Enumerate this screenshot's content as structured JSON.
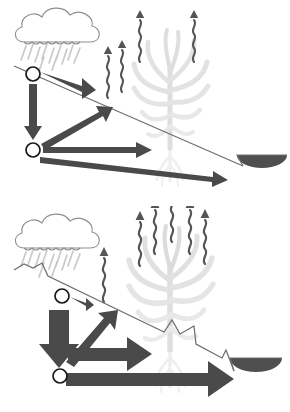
{
  "figure": {
    "background_color": "#ffffff",
    "width": 290,
    "height": 412,
    "panel_count": 2
  },
  "palette": {
    "arrow_gray": "#4a4a4a",
    "arrow_gray_dark": "#3f3f3f",
    "soil_line": "#6e6e6e",
    "cloud_outline": "#8f8f8f",
    "rain_streak": "#c9c9c9",
    "plant_silhouette": "#e2e2e2",
    "plant_root": "#ececec",
    "wavy_arrow": "#555555",
    "pond_fill": "#4f4f4f",
    "node_fill": "#ffffff",
    "node_stroke": "#1a1a1a"
  },
  "panels": [
    {
      "id": "panel-top",
      "name": "sloping-land-panel",
      "scenario": "Conventional sloping cropland",
      "terrain": {
        "type": "smooth-slope",
        "has_terraces": false,
        "terrace_count": 0,
        "start_point": [
          14,
          66
        ],
        "end_point": [
          243,
          166
        ]
      },
      "cloud": {
        "name": "rain-cloud",
        "center": [
          60,
          34
        ],
        "rain_streak_count": 11,
        "rain_intensity": "moderate"
      },
      "nodes": [
        {
          "name": "surface-water-node",
          "cx": 33,
          "cy": 74,
          "r": 7
        },
        {
          "name": "soil-water-node",
          "cx": 33,
          "cy": 150,
          "r": 7
        }
      ],
      "flows": [
        {
          "name": "runoff-arrow",
          "label": "Runoff",
          "direction": "downslope-right",
          "magnitude": "large",
          "style": "wedge"
        },
        {
          "name": "infiltration-arrow",
          "label": "Infiltration",
          "direction": "down",
          "magnitude": "medium",
          "style": "straight"
        },
        {
          "name": "capillary-rise-arrow",
          "label": "Capillary rise / uptake",
          "direction": "up-right",
          "magnitude": "medium",
          "style": "straight"
        },
        {
          "name": "soil-water-storage-arrow",
          "label": "Soil water storage",
          "direction": "right",
          "magnitude": "small",
          "style": "straight"
        },
        {
          "name": "lateral-flow-arrow",
          "label": "Lateral subsurface flow to pond",
          "direction": "right-down",
          "magnitude": "medium",
          "style": "tapered"
        }
      ],
      "evapotranspiration": {
        "name": "evapotranspiration-arrows",
        "count": 4,
        "magnitude": "moderate",
        "arrows": [
          {
            "x": 108,
            "y_bottom": 98,
            "height": 50
          },
          {
            "x": 122,
            "y_bottom": 92,
            "height": 48
          },
          {
            "x": 140,
            "y_bottom": 62,
            "height": 50
          },
          {
            "x": 194,
            "y_bottom": 62,
            "height": 48
          }
        ]
      },
      "plant": {
        "name": "crop-silhouette",
        "species": "maize",
        "vigor": "low",
        "x": 170,
        "y": 30,
        "scale": 1.0
      },
      "pond": {
        "name": "collection-pond",
        "cx": 262,
        "cy": 167,
        "rx": 25,
        "ry": 13,
        "fill_level": "partial"
      }
    },
    {
      "id": "panel-bottom",
      "name": "terraced-land-panel",
      "scenario": "Terraced cropland",
      "terrain": {
        "type": "terraced-slope",
        "has_terraces": true,
        "terrace_count": 3,
        "start_point": [
          14,
          64
        ],
        "end_point": [
          234,
          165
        ]
      },
      "cloud": {
        "name": "rain-cloud",
        "center": [
          60,
          34
        ],
        "rain_streak_count": 11,
        "rain_intensity": "moderate"
      },
      "nodes": [
        {
          "name": "surface-water-node",
          "cx": 62,
          "cy": 90,
          "r": 7
        },
        {
          "name": "soil-water-node",
          "cx": 60,
          "cy": 170,
          "r": 7
        }
      ],
      "flows": [
        {
          "name": "runoff-arrow",
          "label": "Runoff (reduced)",
          "direction": "downslope-right",
          "magnitude": "small",
          "style": "wedge"
        },
        {
          "name": "infiltration-arrow",
          "label": "Infiltration (increased)",
          "direction": "down",
          "magnitude": "large",
          "style": "straight"
        },
        {
          "name": "capillary-rise-arrow",
          "label": "Capillary rise / uptake",
          "direction": "up-right",
          "magnitude": "large",
          "style": "straight"
        },
        {
          "name": "soil-water-storage-arrow",
          "label": "Soil water storage",
          "direction": "right",
          "magnitude": "large",
          "style": "straight"
        },
        {
          "name": "lateral-flow-arrow",
          "label": "Lateral subsurface flow to pond",
          "direction": "right",
          "magnitude": "large",
          "style": "straight"
        }
      ],
      "evapotranspiration": {
        "name": "evapotranspiration-arrows",
        "count": 6,
        "magnitude": "high",
        "arrows": [
          {
            "x": 104,
            "y_bottom": 96,
            "height": 52
          },
          {
            "x": 140,
            "y_bottom": 60,
            "height": 56
          },
          {
            "x": 155,
            "y_bottom": 48,
            "height": 58
          },
          {
            "x": 172,
            "y_bottom": 36,
            "height": 60
          },
          {
            "x": 190,
            "y_bottom": 48,
            "height": 58
          },
          {
            "x": 205,
            "y_bottom": 58,
            "height": 54
          }
        ]
      },
      "plant": {
        "name": "crop-silhouette",
        "species": "maize",
        "vigor": "high",
        "x": 170,
        "y": 24,
        "scale": 1.08
      },
      "pond": {
        "name": "collection-pond",
        "cx": 256,
        "cy": 166,
        "rx": 26,
        "ry": 14,
        "fill_level": "partial"
      }
    }
  ]
}
